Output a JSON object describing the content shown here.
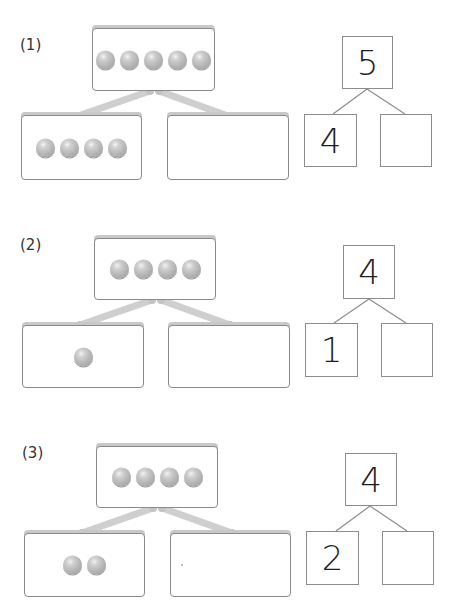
{
  "worksheet": {
    "problems": [
      {
        "label": "(1)",
        "top_beads": 5,
        "left_beads": 4,
        "right_beads": 0,
        "whole": "5",
        "part_left": "4",
        "part_right": ""
      },
      {
        "label": "(2)",
        "top_beads": 4,
        "left_beads": 1,
        "right_beads": 0,
        "whole": "4",
        "part_left": "1",
        "part_right": ""
      },
      {
        "label": "(3)",
        "top_beads": 4,
        "left_beads": 2,
        "right_beads": 0,
        "whole": "4",
        "part_left": "2",
        "part_right": ""
      }
    ],
    "colors": {
      "bead": "#b4b4b4",
      "box_border": "#8a8a8a",
      "connector": "#cfcfcf",
      "number_text": "#1e1e1e"
    }
  }
}
